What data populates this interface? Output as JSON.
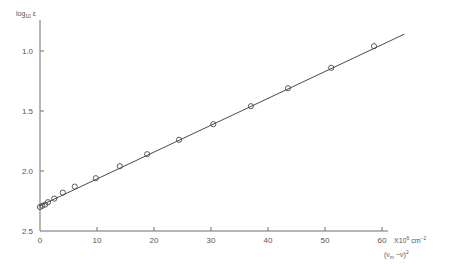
{
  "chart_data": {
    "type": "scatter",
    "title": "",
    "xlabel": "(ν_m − ν)²",
    "xlabel_units": "X10⁶ cm⁻²",
    "ylabel": "log₁₀ ε",
    "xlim": [
      0,
      63
    ],
    "ylim": [
      2.5,
      0.9
    ],
    "y_axis_inverted": true,
    "grid": false,
    "legend": null,
    "x_ticks": [
      0,
      10,
      20,
      30,
      40,
      50,
      60
    ],
    "y_ticks": [
      1.0,
      1.5,
      2.0,
      2.5
    ],
    "x_tick_labels": [
      "0",
      "10",
      "20",
      "30",
      "40",
      "50",
      "60"
    ],
    "y_tick_labels": [
      "1.0",
      "1.5",
      "2.0",
      "2.5"
    ],
    "series": [
      {
        "name": "measured",
        "marker": "open-circle",
        "points": [
          {
            "x": 0.0,
            "y": 2.3
          },
          {
            "x": 0.4,
            "y": 2.29
          },
          {
            "x": 0.9,
            "y": 2.28
          },
          {
            "x": 1.4,
            "y": 2.26
          },
          {
            "x": 2.5,
            "y": 2.23
          },
          {
            "x": 4.0,
            "y": 2.18
          },
          {
            "x": 6.1,
            "y": 2.13
          },
          {
            "x": 9.8,
            "y": 2.06
          },
          {
            "x": 14.0,
            "y": 1.96
          },
          {
            "x": 18.8,
            "y": 1.86
          },
          {
            "x": 24.4,
            "y": 1.74
          },
          {
            "x": 30.4,
            "y": 1.61
          },
          {
            "x": 37.0,
            "y": 1.46
          },
          {
            "x": 43.5,
            "y": 1.31
          },
          {
            "x": 51.1,
            "y": 1.14
          },
          {
            "x": 58.6,
            "y": 0.96
          }
        ]
      },
      {
        "name": "linear fit",
        "marker": "none",
        "line": [
          {
            "x": 0.0,
            "y": 2.29
          },
          {
            "x": 63.9,
            "y": 0.86
          }
        ]
      }
    ]
  },
  "labels": {
    "y_axis_title": "log₁₀ ε",
    "x_axis_units": "X10⁶ cm⁻²",
    "x_axis_title": "(ν_m − ν)²"
  }
}
